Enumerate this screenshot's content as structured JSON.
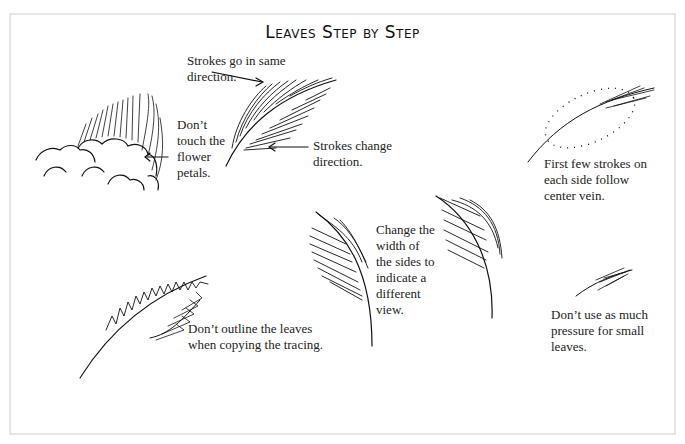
{
  "page": {
    "title": "Leaves Step by Step",
    "captions": {
      "same_direction": [
        "Strokes go in same",
        "direction."
      ],
      "dont_touch": [
        "Don’t",
        "touch the",
        "flower",
        "petals."
      ],
      "change_direction": [
        "Strokes change",
        "direction."
      ],
      "follow_vein": [
        "First few strokes on",
        "each side follow",
        "center vein."
      ],
      "change_width": [
        "Change the",
        "width of",
        "the sides to",
        "indicate a",
        "different",
        "view."
      ],
      "dont_outline": [
        "Don’t outline the leaves",
        "when copying the tracing."
      ],
      "small_leaves": [
        "Don’t use as much",
        "pressure for small",
        "leaves."
      ]
    },
    "illustrations": [
      "flower-petals-with-leaf",
      "leaf-stroke-direction",
      "dotted-leaf-outline-center-vein",
      "leaf-narrow-side-view",
      "leaf-wide-side-view",
      "leaf-tracing-outline",
      "small-leaf"
    ],
    "colors": {
      "ink": "#111111",
      "frame": "#e6e6e6",
      "background": "#ffffff"
    }
  }
}
